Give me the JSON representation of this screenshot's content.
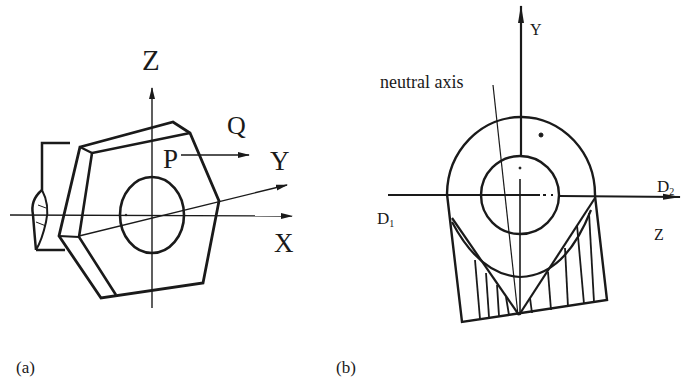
{
  "figure_a": {
    "caption": "(a)",
    "labels": {
      "z_axis": "Z",
      "y_axis": "Y",
      "x_axis": "X",
      "point_p": "P",
      "point_q": "Q"
    }
  },
  "figure_b": {
    "caption": "(b)",
    "labels": {
      "y_axis": "Y",
      "z_axis": "Z",
      "neutral_axis": "neutral axis",
      "d1": "D",
      "d1_sub": "1",
      "d2": "D",
      "d2_sub": "2"
    }
  },
  "colors": {
    "ink": "#1a1a1a",
    "background": "#ffffff"
  }
}
